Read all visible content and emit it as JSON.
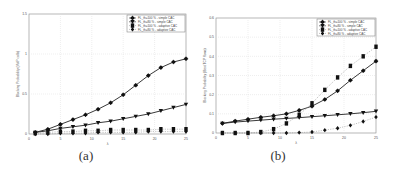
{
  "figure": {
    "captions": [
      "(a)",
      "(b)"
    ]
  },
  "chart_data": [
    {
      "type": "line",
      "panel": "(a)",
      "title": "",
      "xlabel": "λ",
      "ylabel": "Blocking Probability (VoIP calls)",
      "xlim": [
        0,
        25
      ],
      "ylim": [
        0,
        1.5
      ],
      "xticks": [
        0,
        5,
        10,
        15,
        20,
        25
      ],
      "yticks": [
        0,
        0.5,
        1,
        1.5
      ],
      "ytick_labels": [
        "0",
        "0.5",
        "1",
        "1.5"
      ],
      "grid": true,
      "legend_position": "upper right",
      "x": [
        1,
        3,
        5,
        7,
        9,
        11,
        13,
        15,
        17,
        19,
        21,
        23,
        25
      ],
      "series": [
        {
          "name": "FL_th=100 % - simple CAC",
          "marker": "star",
          "line": "solid",
          "values": [
            0.02,
            0.06,
            0.12,
            0.18,
            0.24,
            0.31,
            0.39,
            0.49,
            0.61,
            0.73,
            0.83,
            0.9,
            0.94
          ]
        },
        {
          "name": "FL_th=80 % - simple CAC",
          "marker": "triangle-down",
          "line": "solid",
          "values": [
            0.02,
            0.04,
            0.07,
            0.09,
            0.11,
            0.14,
            0.16,
            0.19,
            0.22,
            0.25,
            0.29,
            0.33,
            0.37
          ]
        },
        {
          "name": "FL_th=100 % - adaptive CAC",
          "marker": "square",
          "line": "dotted",
          "values": [
            0.01,
            0.02,
            0.03,
            0.03,
            0.04,
            0.04,
            0.05,
            0.05,
            0.05,
            0.05,
            0.06,
            0.06,
            0.06
          ]
        },
        {
          "name": "FL_th=80 % - adaptive CAC",
          "marker": "diamond",
          "line": "dotted",
          "values": [
            0.0,
            0.0,
            0.01,
            0.01,
            0.01,
            0.02,
            0.02,
            0.02,
            0.02,
            0.03,
            0.03,
            0.03,
            0.03
          ]
        }
      ]
    },
    {
      "type": "line",
      "panel": "(b)",
      "title": "",
      "xlabel": "λ",
      "ylabel": "Blocking Probability (Best TCP flows)",
      "xlim": [
        0,
        25
      ],
      "ylim": [
        0,
        0.6
      ],
      "xticks": [
        0,
        5,
        10,
        15,
        20,
        25
      ],
      "yticks": [
        0,
        0.1,
        0.2,
        0.3,
        0.4,
        0.5,
        0.6
      ],
      "ytick_labels": [
        "0",
        "0.1",
        "0.2",
        "0.3",
        "0.4",
        "0.5",
        "0.6"
      ],
      "grid": true,
      "legend_position": "upper right",
      "x": [
        1,
        3,
        5,
        7,
        9,
        11,
        13,
        15,
        17,
        19,
        21,
        23,
        25
      ],
      "series": [
        {
          "name": "FL_th=100 % - simple CAC",
          "marker": "star",
          "line": "solid",
          "values": [
            0.05,
            0.062,
            0.072,
            0.082,
            0.09,
            0.1,
            0.118,
            0.14,
            0.175,
            0.22,
            0.275,
            0.325,
            0.375
          ]
        },
        {
          "name": "FL_th=80 % - simple CAC",
          "marker": "triangle-down",
          "line": "solid",
          "values": [
            0.05,
            0.057,
            0.062,
            0.067,
            0.072,
            0.076,
            0.08,
            0.085,
            0.09,
            0.095,
            0.1,
            0.106,
            0.113
          ]
        },
        {
          "name": "FL_th=100 % - adaptive CAC",
          "marker": "square",
          "line": "dotted",
          "values": [
            0.0,
            0.0,
            0.0,
            0.005,
            0.02,
            0.05,
            0.095,
            0.155,
            0.225,
            0.29,
            0.35,
            0.4,
            0.45
          ]
        },
        {
          "name": "FL_th=80 % - adaptive CAC",
          "marker": "diamond",
          "line": "dotted",
          "values": [
            0.0,
            0.0,
            0.0,
            0.0,
            0.0,
            0.0,
            0.002,
            0.005,
            0.015,
            0.025,
            0.04,
            0.06,
            0.083
          ]
        }
      ]
    }
  ]
}
